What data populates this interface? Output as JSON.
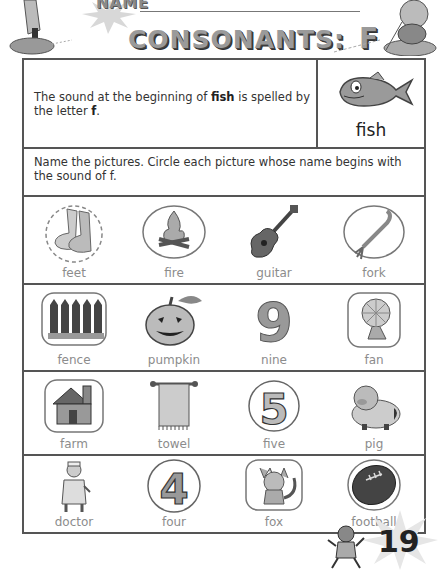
{
  "header": {
    "name_label": "NAME",
    "title": "CONSONANTS:",
    "title_letter": "F"
  },
  "intro": {
    "text_before": "The sound at the beginning of ",
    "keyword": "fish",
    "text_middle": " is spelled by the letter ",
    "letter": "f",
    "text_after": ".",
    "picture_word": "fish",
    "picture_icon": "fish-icon"
  },
  "instructions": "Name the pictures. Circle each picture whose name begins with the sound of f.",
  "rows": [
    {
      "items": [
        {
          "word": "feet",
          "icon": "feet-icon",
          "frame": "dashed-circle"
        },
        {
          "word": "fire",
          "icon": "campfire-icon",
          "frame": "oval"
        },
        {
          "word": "guitar",
          "icon": "guitar-icon",
          "frame": "none"
        },
        {
          "word": "fork",
          "icon": "fork-icon",
          "frame": "oval"
        }
      ]
    },
    {
      "items": [
        {
          "word": "fence",
          "icon": "fence-icon",
          "frame": "rounded-square"
        },
        {
          "word": "pumpkin",
          "icon": "pumpkin-icon",
          "frame": "none"
        },
        {
          "word": "nine",
          "icon": "number-nine-icon",
          "frame": "none"
        },
        {
          "word": "fan",
          "icon": "fan-icon",
          "frame": "rounded-square"
        }
      ]
    },
    {
      "items": [
        {
          "word": "farm",
          "icon": "farmhouse-icon",
          "frame": "rounded-square"
        },
        {
          "word": "towel",
          "icon": "towel-icon",
          "frame": "none"
        },
        {
          "word": "five",
          "icon": "number-five-icon",
          "frame": "circle"
        },
        {
          "word": "pig",
          "icon": "pig-icon",
          "frame": "none"
        }
      ]
    },
    {
      "items": [
        {
          "word": "doctor",
          "icon": "doctor-icon",
          "frame": "none"
        },
        {
          "word": "four",
          "icon": "number-four-icon",
          "frame": "circle"
        },
        {
          "word": "fox",
          "icon": "fox-icon",
          "frame": "rounded-square"
        },
        {
          "word": "football",
          "icon": "football-icon",
          "frame": "oval"
        }
      ]
    }
  ],
  "page_number": "19"
}
